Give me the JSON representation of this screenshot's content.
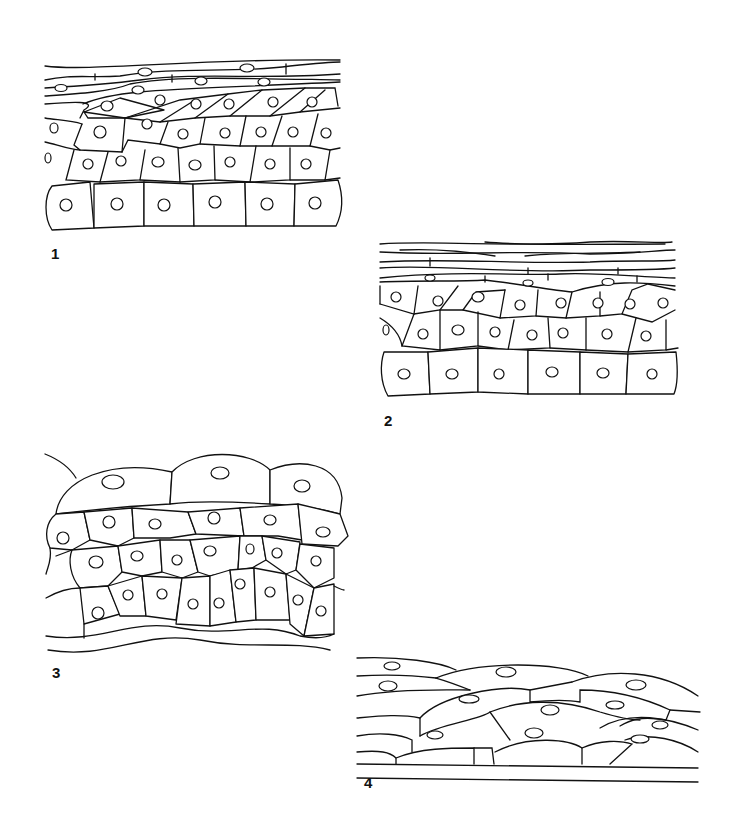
{
  "figure": {
    "panels": [
      {
        "id": "1",
        "label": "1",
        "description": "stratified epithelium with flattened superficial layers"
      },
      {
        "id": "2",
        "label": "2",
        "description": "stratified epithelium with keratinized surface layers"
      },
      {
        "id": "3",
        "label": "3",
        "description": "transitional epithelium with dome-shaped surface cells"
      },
      {
        "id": "4",
        "label": "4",
        "description": "transitional epithelium, stretched state"
      }
    ],
    "colors": {
      "ink": "#111111",
      "background": "#ffffff"
    }
  }
}
